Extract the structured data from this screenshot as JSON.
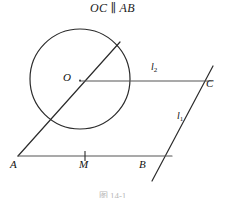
{
  "title": "OC ∥ AB",
  "caption": "图 14-1",
  "figure": {
    "type": "geometry-diagram",
    "stroke_color": "#2b2b2b",
    "background": "#ffffff",
    "circle": {
      "label": "circle-O",
      "cx": 80,
      "cy": 79,
      "r": 50
    },
    "points": [
      {
        "name": "O",
        "x": 80,
        "y": 80,
        "label": "O",
        "label_x": 64,
        "label_y": 72
      },
      {
        "name": "A",
        "x": 18,
        "y": 156,
        "label": "A",
        "label_x": 11,
        "label_y": 160
      },
      {
        "name": "M",
        "x": 85,
        "y": 156,
        "label": "M",
        "label_x": 79,
        "label_y": 160
      },
      {
        "name": "B",
        "x": 143,
        "y": 156,
        "label": "B",
        "label_x": 140,
        "label_y": 160
      },
      {
        "name": "C",
        "x": 205,
        "y": 82,
        "label": "C",
        "label_x": 206,
        "label_y": 80
      }
    ],
    "lines": [
      {
        "name": "line-AB",
        "x1": 18,
        "y1": 156,
        "x2": 172,
        "y2": 156
      },
      {
        "name": "line-OC",
        "x1": 80,
        "y1": 81,
        "x2": 212,
        "y2": 81
      },
      {
        "name": "line-l1-through-A",
        "x1": 18,
        "y1": 156,
        "x2": 120,
        "y2": 42
      },
      {
        "name": "line-l1-through-B",
        "x1": 152,
        "y1": 181,
        "x2": 213,
        "y2": 66
      }
    ],
    "tick_marks": [
      {
        "name": "tick-M",
        "x": 85,
        "y1": 151,
        "y2": 160
      }
    ],
    "line_labels": [
      {
        "name": "l2",
        "text": "l",
        "sub": "2",
        "x": 152,
        "y": 67
      },
      {
        "name": "l1",
        "text": "l",
        "sub": "1",
        "x": 178,
        "y": 116
      }
    ]
  }
}
